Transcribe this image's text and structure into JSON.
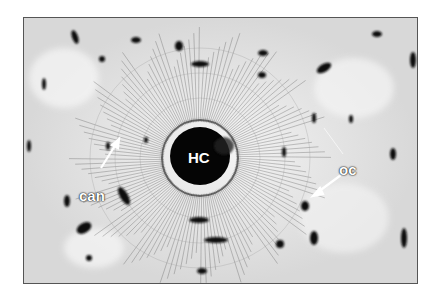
{
  "figure": {
    "labels": {
      "haversian_canal": "HC",
      "canaliculi": "can",
      "osteocyte": "oc"
    },
    "colors": {
      "background": "#ffffff",
      "matrix": "#e6e6e6",
      "dark": "#0a0a0a",
      "label_text": "#ffffff"
    }
  }
}
